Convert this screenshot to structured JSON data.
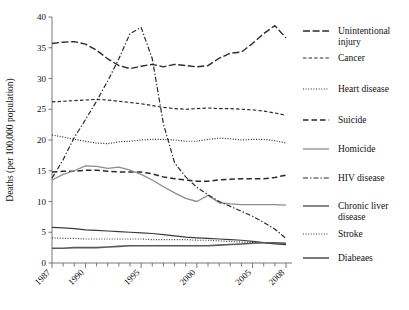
{
  "chart_data": {
    "type": "line",
    "title": "",
    "xlabel": "",
    "ylabel": "Deaths (per 100,000 population)",
    "xlim": [
      1987,
      2008
    ],
    "ylim": [
      0,
      40
    ],
    "yticks": [
      0,
      5,
      10,
      15,
      20,
      25,
      30,
      35,
      40
    ],
    "xticks": [
      1987,
      1990,
      1995,
      2000,
      2005,
      2008
    ],
    "xtick_labels": [
      "1987",
      "1990",
      "1995",
      "2000",
      "2005",
      "2008"
    ],
    "ytick_labels": [
      "0",
      "5",
      "10",
      "15",
      "20",
      "25",
      "30",
      "35",
      "40"
    ],
    "grid": false,
    "legend_position": "right",
    "x": [
      1987,
      1988,
      1989,
      1990,
      1991,
      1992,
      1993,
      1994,
      1995,
      1996,
      1997,
      1998,
      1999,
      2000,
      2001,
      2002,
      2003,
      2004,
      2005,
      2006,
      2007,
      2008
    ],
    "series": [
      {
        "name": "Unintentional injury",
        "dash": "long-dash-dot",
        "color": "#2b2b2b",
        "width": 1.4,
        "values": [
          35.7,
          35.9,
          36.0,
          35.6,
          34.6,
          33.2,
          32.1,
          31.6,
          32.0,
          32.3,
          31.9,
          32.3,
          32.1,
          31.9,
          32.1,
          33.3,
          34.1,
          34.3,
          35.7,
          37.3,
          38.6,
          36.6
        ]
      },
      {
        "name": "Cancer",
        "dash": "medium-dash",
        "color": "#2b2b2b",
        "width": 1.2,
        "values": [
          26.2,
          26.3,
          26.4,
          26.5,
          26.6,
          26.5,
          26.3,
          26.1,
          25.9,
          25.6,
          25.3,
          25.1,
          25.0,
          25.1,
          25.2,
          25.1,
          25.1,
          25.0,
          24.9,
          24.7,
          24.4,
          24.0
        ]
      },
      {
        "name": "Heart disease",
        "dash": "fine-dot",
        "color": "#2b2b2b",
        "width": 1.2,
        "values": [
          20.8,
          20.5,
          20.1,
          19.8,
          19.5,
          19.4,
          19.7,
          19.8,
          20.0,
          20.1,
          20.1,
          20.0,
          19.8,
          19.8,
          20.1,
          20.3,
          20.2,
          20.0,
          20.1,
          20.1,
          19.9,
          19.5
        ]
      },
      {
        "name": "Suicide",
        "dash": "big-dash",
        "color": "#2b2b2b",
        "width": 1.5,
        "values": [
          14.8,
          14.9,
          14.9,
          15.1,
          15.1,
          14.9,
          14.8,
          14.8,
          14.8,
          14.5,
          14.0,
          13.7,
          13.5,
          13.3,
          13.3,
          13.5,
          13.6,
          13.7,
          13.7,
          13.7,
          13.9,
          14.3
        ]
      },
      {
        "name": "Homicide",
        "dash": "solid",
        "color": "#8c8c8c",
        "width": 1.3,
        "values": [
          13.5,
          14.4,
          15.0,
          15.8,
          15.7,
          15.4,
          15.6,
          15.1,
          14.4,
          13.5,
          12.4,
          11.4,
          10.5,
          10.0,
          11.0,
          9.8,
          9.6,
          9.5,
          9.5,
          9.5,
          9.5,
          9.4
        ]
      },
      {
        "name": "HIV disease",
        "dash": "dash-dot",
        "color": "#2b2b2b",
        "width": 1.2,
        "values": [
          13.8,
          16.8,
          20.4,
          23.3,
          26.3,
          29.6,
          33.2,
          37.3,
          38.3,
          33.2,
          22.6,
          16.3,
          14.0,
          12.3,
          11.1,
          10.0,
          9.2,
          8.4,
          7.6,
          6.6,
          5.5,
          4.0
        ]
      },
      {
        "name": "Chronic liver disease",
        "dash": "solid",
        "color": "#3a3a3a",
        "width": 1.2,
        "values": [
          5.8,
          5.7,
          5.6,
          5.4,
          5.3,
          5.2,
          5.1,
          5.0,
          4.9,
          4.8,
          4.6,
          4.4,
          4.2,
          4.1,
          4.0,
          3.9,
          3.8,
          3.7,
          3.5,
          3.3,
          3.1,
          3.0
        ]
      },
      {
        "name": "Stroke",
        "dash": "fine-dot",
        "color": "#3a3a3a",
        "width": 1.2,
        "values": [
          4.1,
          4.0,
          4.0,
          3.9,
          3.9,
          3.9,
          3.9,
          3.9,
          3.9,
          3.8,
          3.8,
          3.8,
          3.8,
          3.7,
          3.7,
          3.6,
          3.5,
          3.4,
          3.3,
          3.3,
          3.2,
          3.2
        ]
      },
      {
        "name": "Diabeaes",
        "dash": "solid",
        "color": "#5a5a5a",
        "width": 1.6,
        "values": [
          2.4,
          2.4,
          2.5,
          2.5,
          2.5,
          2.6,
          2.7,
          2.8,
          2.8,
          2.8,
          2.8,
          2.8,
          2.8,
          2.8,
          2.8,
          2.9,
          3.0,
          3.1,
          3.2,
          3.3,
          3.3,
          3.2
        ]
      }
    ]
  },
  "legend": {
    "items": [
      {
        "label_line1": "Unintentional",
        "label_line2": "injury"
      },
      {
        "label_line1": "Cancer",
        "label_line2": ""
      },
      {
        "label_line1": "Heart disease",
        "label_line2": ""
      },
      {
        "label_line1": "Suicide",
        "label_line2": ""
      },
      {
        "label_line1": "Homicide",
        "label_line2": ""
      },
      {
        "label_line1": "HIV disease",
        "label_line2": ""
      },
      {
        "label_line1": "Chronic liver",
        "label_line2": "disease"
      },
      {
        "label_line1": "Stroke",
        "label_line2": ""
      },
      {
        "label_line1": "Diabeaes",
        "label_line2": ""
      }
    ]
  }
}
